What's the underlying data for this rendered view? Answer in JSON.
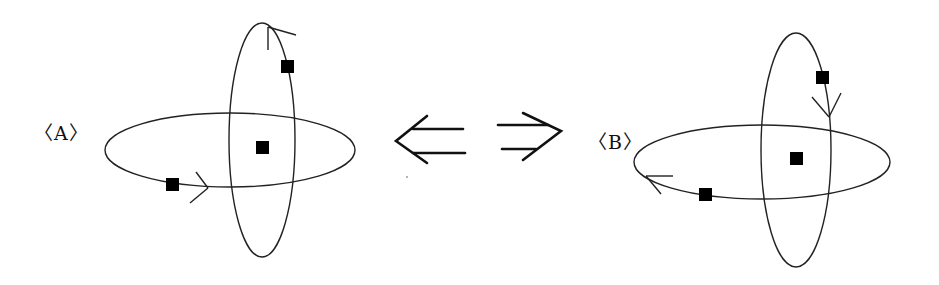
{
  "diagram": {
    "stroke_color": "#222222",
    "fill_color": "#000000",
    "connector": {
      "left_arrow": "⇐",
      "right_arrow": "⇒"
    },
    "panels": [
      {
        "label": "〈A〉",
        "horizontal_orbit": {
          "cx": 230,
          "cy": 150,
          "rx": 125,
          "ry": 37,
          "direction": "counterclockwise (arrow on bottom pointing right)"
        },
        "vertical_orbit": {
          "cx": 262,
          "cy": 140,
          "rx": 33,
          "ry": 117,
          "direction": "arrow near top pointing up-left"
        },
        "bodies": [
          {
            "name": "central-body",
            "x": 262,
            "y": 147
          },
          {
            "name": "vertical-orbit-body",
            "x": 287,
            "y": 66
          },
          {
            "name": "horizontal-orbit-body",
            "x": 172,
            "y": 184
          }
        ]
      },
      {
        "label": "〈B〉",
        "horizontal_orbit": {
          "cx": 762,
          "cy": 162,
          "rx": 128,
          "ry": 37,
          "direction": "clockwise (arrow on lower-left pointing left)"
        },
        "vertical_orbit": {
          "cx": 796,
          "cy": 150,
          "rx": 35,
          "ry": 117,
          "direction": "arrow on right side pointing down"
        },
        "bodies": [
          {
            "name": "central-body",
            "x": 797,
            "y": 158
          },
          {
            "name": "vertical-orbit-body",
            "x": 822,
            "y": 77
          },
          {
            "name": "horizontal-orbit-body",
            "x": 705,
            "y": 194
          }
        ]
      }
    ]
  }
}
